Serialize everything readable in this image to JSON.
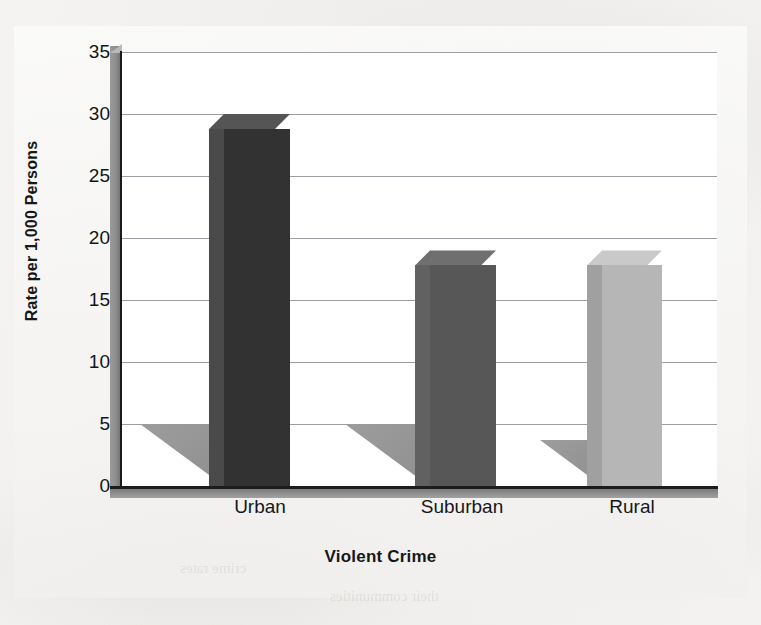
{
  "chart_data": {
    "type": "bar",
    "title": "",
    "xlabel": "Violent Crime",
    "ylabel": "Rate per 1,000 Persons",
    "categories": [
      "Urban",
      "Suburban",
      "Rural"
    ],
    "values": [
      30,
      19,
      19
    ],
    "ylim": [
      0,
      35
    ],
    "yticks": [
      0,
      5,
      10,
      15,
      20,
      25,
      30,
      35
    ],
    "ytick_labels": [
      "0",
      "5",
      "10",
      "15",
      "20",
      "25",
      "30",
      "35"
    ],
    "grid": "horizontal",
    "legend": "none",
    "style": "3d-column",
    "series": [
      {
        "name": "Rate per 1,000 Persons",
        "values": [
          30,
          19,
          19
        ],
        "bar_colors": [
          "#323232",
          "#575757",
          "#b6b6b6"
        ],
        "bar_top_colors": [
          "#555555",
          "#6f6f6f",
          "#c9c9c9"
        ],
        "bar_side_colors": [
          "#4a4a4a",
          "#616161",
          "#a0a0a0"
        ]
      }
    ]
  },
  "axes": {
    "y_title": "Rate per 1,000 Persons",
    "x_title": "Violent Crime",
    "y_tick_labels": [
      "35",
      "30",
      "25",
      "20",
      "15",
      "10",
      "5",
      "0"
    ],
    "x_tick_labels": [
      "Urban",
      "Suburban",
      "Rural"
    ]
  },
  "colors": {
    "gridline": "#9a9ea2",
    "plot_background": "#ffffff",
    "page_background": "#f2f1ef",
    "axis_line": "#1a1a1a",
    "floor": "#838383",
    "wall": "#8d8d8d",
    "bar_urban": "#323232",
    "bar_suburban": "#575757",
    "bar_rural": "#b6b6b6",
    "shadow": "#9a9a9a",
    "text": "#15171a"
  },
  "ghost_text": {
    "a": "a human being",
    "b": "the nature of",
    "c": "crime rates",
    "d": "their communities",
    "e": "neighborhood"
  }
}
